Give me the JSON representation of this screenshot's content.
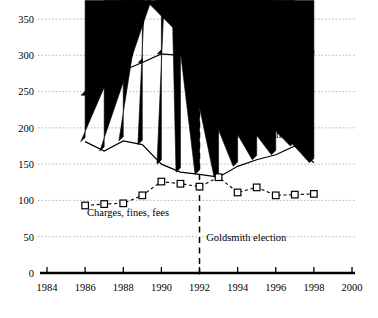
{
  "chart_data": {
    "type": "line",
    "title": "",
    "subtitle": "",
    "xlabel": "",
    "ylabel": "",
    "x": [
      1986,
      1987,
      1988,
      1989,
      1990,
      1991,
      1992,
      1993,
      1994,
      1995,
      1996,
      1997,
      1998
    ],
    "xlim": [
      1984,
      2000
    ],
    "ylim": [
      0,
      350
    ],
    "xticks": [
      1984,
      1986,
      1988,
      1990,
      1992,
      1994,
      1996,
      1998,
      2000
    ],
    "xtick_labels": [
      "1984",
      "1986",
      "1988",
      "1990",
      "1992",
      "1994",
      "1996",
      "1998",
      "2000"
    ],
    "yticks": [
      0,
      50,
      100,
      150,
      200,
      250,
      300,
      350
    ],
    "ytick_labels": [
      "0",
      "50",
      "100",
      "150",
      "200",
      "250",
      "300",
      "350"
    ],
    "grid": "horizontal-dotted",
    "legend_position": "inline-labels",
    "series": [
      {
        "name": "Taxes",
        "marker": "filled-diamond",
        "line_style": "solid",
        "color": "#000000",
        "values": [
          245,
          275,
          279,
          290,
          302,
          300,
          301,
          297,
          294,
          317,
          302,
          301,
          302
        ],
        "label_x": 1986.1,
        "label_y": 262
      },
      {
        "name": "Intergovernmental",
        "marker": "filled-triangle",
        "line_style": "solid",
        "color": "#000000",
        "values": [
          181,
          168,
          182,
          177,
          150,
          139,
          136,
          132,
          147,
          156,
          163,
          175,
          152
        ],
        "label_x": 1993.45,
        "label_y": 186
      },
      {
        "name": "Charges, fines, fees",
        "marker": "open-square",
        "line_style": "dashed",
        "color": "#000000",
        "values": [
          93,
          95,
          96,
          107,
          126,
          123,
          119,
          132,
          111,
          118,
          107,
          108,
          109
        ],
        "label_x": 1986.1,
        "label_y": 78
      }
    ],
    "annotations": [
      {
        "name": "goldsmith-election",
        "text": "Goldsmith election",
        "type": "vertical-dashed-line",
        "x": 1992,
        "label_x": 1992.35,
        "label_y": 44
      }
    ]
  }
}
